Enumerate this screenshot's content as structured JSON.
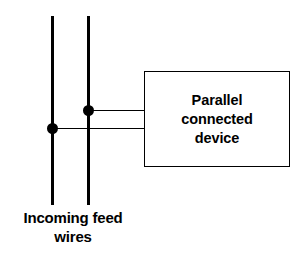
{
  "diagram": {
    "title_text_lines": [
      "Parallel",
      "connected",
      "device"
    ],
    "caption_lines": [
      "Incoming feed",
      "wires"
    ],
    "colors": {
      "stroke": "#000000",
      "background": "#ffffff"
    },
    "wires": [
      {
        "name": "left-feed-wire",
        "x": 52,
        "y_top": 16,
        "y_bottom": 205,
        "thickness": 3
      },
      {
        "name": "right-feed-wire",
        "x": 88,
        "y_top": 16,
        "y_bottom": 205,
        "thickness": 3
      }
    ],
    "junctions": [
      {
        "name": "right-wire-junction",
        "cx": 88,
        "cy": 110,
        "diameter": 11
      },
      {
        "name": "left-wire-junction",
        "cx": 52,
        "cy": 128,
        "diameter": 11
      }
    ],
    "leads": [
      {
        "name": "upper-lead",
        "x_start": 88,
        "x_end": 144,
        "y": 110,
        "thickness": 1
      },
      {
        "name": "lower-lead",
        "x_start": 52,
        "x_end": 144,
        "y": 128,
        "thickness": 1
      }
    ],
    "device_box": {
      "x": 144,
      "y": 71,
      "width": 146,
      "height": 96
    }
  }
}
